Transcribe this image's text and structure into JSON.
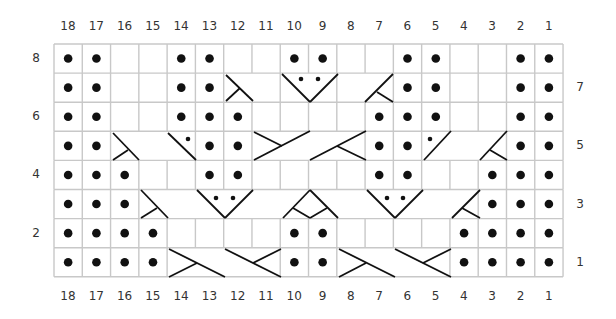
{
  "chart": {
    "columns": [
      18,
      17,
      16,
      15,
      14,
      13,
      12,
      11,
      10,
      9,
      8,
      7,
      6,
      5,
      4,
      3,
      2,
      1
    ],
    "rows_left_labels": [
      8,
      6,
      4,
      2
    ],
    "rows_right_labels": [
      7,
      5,
      3,
      1
    ],
    "grid": {
      "left": 54,
      "top": 44,
      "col_width": 28.28,
      "row_height": 29.1,
      "cols": 18,
      "rows": 8,
      "line_color": "#c8c8c8"
    },
    "symbol_color": "#111111",
    "rows": [
      {
        "row": 8,
        "purl_cols": [
          18,
          17,
          14,
          13,
          10,
          9,
          6,
          5,
          2,
          1
        ],
        "merged": []
      },
      {
        "row": 7,
        "purl_cols": [
          18,
          17,
          14,
          13,
          6,
          5,
          2,
          1
        ],
        "merged": [
          [
            12,
            11
          ],
          [
            10,
            9
          ],
          [
            8,
            7
          ]
        ]
      },
      {
        "row": 6,
        "purl_cols": [
          18,
          17,
          14,
          13,
          12,
          7,
          6,
          5,
          2,
          1
        ],
        "merged": []
      },
      {
        "row": 5,
        "purl_cols": [
          18,
          17,
          13,
          12,
          7,
          6,
          2,
          1
        ],
        "merged": [
          [
            16,
            15
          ],
          [
            15,
            14
          ],
          [
            11,
            10
          ],
          [
            10,
            9
          ],
          [
            9,
            8
          ],
          [
            5,
            4
          ],
          [
            4,
            3
          ]
        ]
      },
      {
        "row": 4,
        "purl_cols": [
          18,
          17,
          16,
          13,
          12,
          7,
          6,
          3,
          2,
          1
        ],
        "merged": []
      },
      {
        "row": 3,
        "purl_cols": [
          18,
          17,
          16,
          3,
          2,
          1
        ],
        "merged": [
          [
            15,
            14
          ],
          [
            14,
            13
          ],
          [
            13,
            12
          ],
          [
            12,
            11
          ],
          [
            11,
            10
          ],
          [
            10,
            9
          ],
          [
            9,
            8
          ],
          [
            8,
            7
          ],
          [
            7,
            6
          ],
          [
            6,
            5
          ],
          [
            5,
            4
          ]
        ]
      },
      {
        "row": 2,
        "purl_cols": [
          18,
          17,
          16,
          15,
          10,
          9,
          4,
          3,
          2,
          1
        ],
        "merged": []
      },
      {
        "row": 1,
        "purl_cols": [
          18,
          17,
          16,
          15,
          10,
          9,
          4,
          3,
          2,
          1
        ],
        "merged": [
          [
            14,
            13
          ],
          [
            13,
            12
          ],
          [
            12,
            11
          ],
          [
            8,
            7
          ],
          [
            7,
            6
          ],
          [
            6,
            5
          ]
        ]
      }
    ],
    "cable_lines": [
      [
        226,
        75,
        253,
        101
      ],
      [
        226,
        101,
        240,
        88
      ],
      [
        282,
        74,
        310,
        102
      ],
      [
        310,
        102,
        338,
        74
      ],
      [
        365,
        102,
        393,
        74
      ],
      [
        377,
        92,
        393,
        102
      ],
      [
        113,
        133,
        139,
        160
      ],
      [
        113,
        160,
        128,
        150
      ],
      [
        168,
        133,
        196,
        160
      ],
      [
        254,
        132,
        282,
        146
      ],
      [
        254,
        160,
        310,
        131
      ],
      [
        310,
        160,
        366,
        131
      ],
      [
        337,
        146,
        366,
        160
      ],
      [
        424,
        160,
        451,
        131
      ],
      [
        480,
        160,
        507,
        131
      ],
      [
        490,
        150,
        507,
        160
      ],
      [
        141,
        190,
        168,
        218
      ],
      [
        141,
        218,
        157,
        208
      ],
      [
        197,
        190,
        225,
        218
      ],
      [
        225,
        218,
        253,
        190
      ],
      [
        283,
        218,
        310,
        190
      ],
      [
        310,
        190,
        338,
        218
      ],
      [
        293,
        208,
        310,
        218
      ],
      [
        310,
        218,
        327,
        208
      ],
      [
        367,
        190,
        395,
        218
      ],
      [
        395,
        218,
        423,
        190
      ],
      [
        452,
        218,
        480,
        190
      ],
      [
        462,
        208,
        480,
        218
      ],
      [
        169,
        249,
        225,
        277
      ],
      [
        169,
        277,
        197,
        263
      ],
      [
        225,
        249,
        281,
        277
      ],
      [
        253,
        263,
        281,
        249
      ],
      [
        339,
        249,
        395,
        277
      ],
      [
        339,
        277,
        366,
        263
      ],
      [
        395,
        249,
        451,
        277
      ],
      [
        423,
        263,
        451,
        249
      ]
    ],
    "small_dots": [
      [
        301,
        79
      ],
      [
        318,
        79
      ],
      [
        188,
        139
      ],
      [
        430,
        139
      ],
      [
        216,
        198
      ],
      [
        233,
        198
      ],
      [
        387,
        198
      ],
      [
        403,
        198
      ]
    ]
  },
  "legend_text": {
    "top_labels": [
      "18",
      "17",
      "16",
      "15",
      "14",
      "13",
      "12",
      "11",
      "10",
      "9",
      "8",
      "7",
      "6",
      "5",
      "4",
      "3",
      "2",
      "1"
    ],
    "bottom_labels": [
      "18",
      "17",
      "16",
      "15",
      "14",
      "13",
      "12",
      "11",
      "10",
      "9",
      "8",
      "7",
      "6",
      "5",
      "4",
      "3",
      "2",
      "1"
    ],
    "left_labels": [
      "8",
      "6",
      "4",
      "2"
    ],
    "right_labels": [
      "7",
      "5",
      "3",
      "1"
    ]
  }
}
